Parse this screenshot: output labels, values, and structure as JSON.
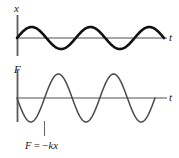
{
  "figure": {
    "name": "hookes-law-waveforms",
    "background_color": "#ffffff",
    "panels": [
      {
        "id": "displacement-panel",
        "y_axis_label": "x",
        "x_axis_label": "t",
        "wave_color": "#111111",
        "wave_stroke_width": 2.6,
        "axis_color": "#8a8a8a",
        "y_axis_color": "#5a5a5a"
      },
      {
        "id": "force-panel",
        "y_axis_label": "F",
        "x_axis_label": "t",
        "wave_color": "#4a4a4a",
        "wave_stroke_width": 1.5,
        "axis_color": "#8a8a8a",
        "y_axis_color": "#5a5a5a"
      }
    ],
    "annotation": {
      "id": "force-equation",
      "symbol_f": "F",
      "equals": "=",
      "minus": "−",
      "spring_constant": "k",
      "displacement": "x",
      "full_text": "F = −kx",
      "leader_line_color": "#6a6a6a"
    }
  },
  "chart_data": {
    "type": "line",
    "title": "",
    "xlabel": "t",
    "ylabel": "x / F",
    "grid": false,
    "legend": null,
    "series": [
      {
        "name": "x",
        "panel": "displacement-panel",
        "function": "A*sin(2*pi*t/T)",
        "amplitude": 11,
        "periods": 2.5,
        "phase": "starts at zero rising",
        "baseline_y": 38,
        "x_start": 17,
        "x_end": 164,
        "ylim": [
          -11,
          11
        ]
      },
      {
        "name": "F",
        "panel": "force-panel",
        "function": "-kA*sin(2*pi*t/T)",
        "amplitude": 24,
        "periods": 2.5,
        "phase": "starts at zero falling",
        "baseline_y": 98,
        "x_start": 17,
        "x_end": 155,
        "ylim": [
          -24,
          24
        ]
      }
    ],
    "relationship": "F = −kx"
  }
}
